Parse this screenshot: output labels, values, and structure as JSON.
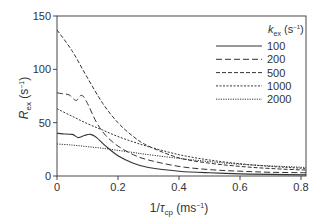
{
  "chart_data": {
    "type": "line",
    "title": "",
    "xlabel": "1/τcp (ms⁻¹)",
    "ylabel": "Rex (s⁻¹)",
    "xlim": [
      0,
      0.82
    ],
    "ylim": [
      0,
      150
    ],
    "xticks": [
      0,
      0.2,
      0.4,
      0.6,
      0.8
    ],
    "xtick_labels": [
      "0",
      "0.2",
      "0.4",
      "0.6",
      "0.8"
    ],
    "yticks": [
      0,
      50,
      100,
      150
    ],
    "ytick_labels": [
      "0",
      "50",
      "100",
      "150"
    ],
    "grid": false,
    "legend": {
      "title": "kex (s⁻¹)",
      "position": "upper right"
    },
    "series": [
      {
        "name": "100",
        "style": "solid",
        "x": [
          0,
          0.02,
          0.05,
          0.07,
          0.09,
          0.11,
          0.13,
          0.16,
          0.2,
          0.25,
          0.3,
          0.4,
          0.5,
          0.6,
          0.7,
          0.82
        ],
        "y": [
          40,
          39.5,
          39,
          36,
          38,
          39,
          36,
          28,
          19,
          12,
          8,
          4.5,
          3,
          2,
          1.5,
          1
        ]
      },
      {
        "name": "200",
        "style": "dashed",
        "x": [
          0,
          0.02,
          0.04,
          0.055,
          0.065,
          0.075,
          0.085,
          0.1,
          0.13,
          0.16,
          0.2,
          0.25,
          0.3,
          0.4,
          0.5,
          0.6,
          0.7,
          0.82
        ],
        "y": [
          78,
          77,
          76,
          72,
          71,
          75,
          75,
          68,
          50,
          38,
          28,
          20,
          15,
          9,
          6,
          4.5,
          3.5,
          3
        ]
      },
      {
        "name": "500",
        "style": "dashed-fine",
        "x": [
          0,
          0.05,
          0.1,
          0.15,
          0.2,
          0.25,
          0.3,
          0.4,
          0.5,
          0.6,
          0.7,
          0.82
        ],
        "y": [
          137,
          117,
          92,
          68,
          50,
          37,
          28,
          17,
          12,
          9,
          7,
          5.5
        ]
      },
      {
        "name": "1000",
        "style": "dotted",
        "x": [
          0,
          0.05,
          0.1,
          0.15,
          0.2,
          0.25,
          0.3,
          0.4,
          0.5,
          0.6,
          0.7,
          0.82
        ],
        "y": [
          63,
          56,
          49,
          43,
          37,
          32,
          27.5,
          20,
          15,
          11.5,
          9,
          7
        ]
      },
      {
        "name": "2000",
        "style": "dotted-fine",
        "x": [
          0,
          0.05,
          0.1,
          0.15,
          0.2,
          0.25,
          0.3,
          0.4,
          0.5,
          0.6,
          0.7,
          0.82
        ],
        "y": [
          30,
          29,
          27.5,
          26,
          24,
          22,
          20,
          16.5,
          13.5,
          11,
          9.5,
          8
        ]
      }
    ]
  },
  "labels": {
    "y_axis_main": "R",
    "y_axis_sub": "ex",
    "y_axis_unit_pre": " (s",
    "y_axis_unit_exp": "−1",
    "y_axis_unit_post": ")",
    "x_axis_pre": "1/",
    "x_axis_main": "τ",
    "x_axis_sub": "cp",
    "x_axis_unit_pre": " (ms",
    "x_axis_unit_exp": "−1",
    "x_axis_unit_post": ")",
    "legend_title_main": "k",
    "legend_title_sub": "ex",
    "legend_title_unit_pre": " (s",
    "legend_title_unit_exp": "−1",
    "legend_title_unit_post": ")"
  }
}
